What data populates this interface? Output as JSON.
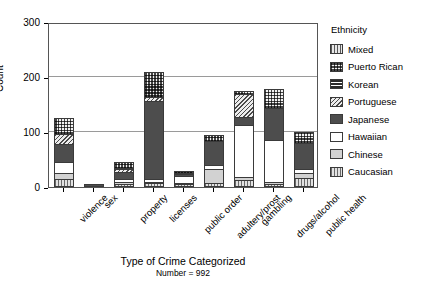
{
  "chart_data": {
    "type": "bar",
    "subtype": "stacked-bar",
    "title": "",
    "xlabel": "Type of Crime Categorized",
    "xsublabel": "Number = 992",
    "ylabel": "Count",
    "ylim": [
      0,
      300
    ],
    "yticks": [
      0,
      100,
      200,
      300
    ],
    "ytick_labels": [
      "0",
      "100",
      "200",
      "300"
    ],
    "grid": "horizontal",
    "legend_title": "Ethnicity",
    "legend_position": "right",
    "categories": [
      "violence",
      "sex",
      "property",
      "licenses",
      "public order",
      "adultery/prost",
      "gambling",
      "drugs/alcohol",
      "public health"
    ],
    "series": [
      {
        "name": "Mixed",
        "pattern": "p-mixed",
        "values": [
          0,
          0,
          0,
          0,
          0,
          0,
          0,
          0,
          0
        ]
      },
      {
        "name": "Puerto Rican",
        "pattern": "p-puertorican",
        "values": [
          28,
          0,
          10,
          47,
          4,
          12,
          6,
          35,
          20
        ]
      },
      {
        "name": "Korean",
        "pattern": "p-korean",
        "values": [
          0,
          0,
          3,
          0,
          0,
          0,
          0,
          0,
          0
        ]
      },
      {
        "name": "Portuguese",
        "pattern": "p-portuguese",
        "values": [
          19,
          0,
          4,
          6,
          3,
          0,
          42,
          0,
          0
        ]
      },
      {
        "name": "Japanese",
        "pattern": "p-japanese",
        "values": [
          33,
          4,
          14,
          142,
          3,
          43,
          15,
          58,
          48
        ]
      },
      {
        "name": "Hawaiian",
        "pattern": "p-hawaiian",
        "values": [
          20,
          0,
          5,
          6,
          12,
          8,
          93,
          76,
          7
        ]
      },
      {
        "name": "Chinese",
        "pattern": "p-chinese",
        "values": [
          10,
          0,
          3,
          2,
          3,
          24,
          6,
          3,
          9
        ]
      },
      {
        "name": "Caucasian",
        "pattern": "p-caucasian",
        "values": [
          15,
          1,
          6,
          7,
          5,
          8,
          13,
          6,
          16
        ]
      }
    ],
    "totals": [
      125,
      5,
      45,
      210,
      30,
      95,
      175,
      178,
      100
    ]
  },
  "legend": {
    "title": "Ethnicity",
    "items": [
      {
        "label": "Mixed",
        "pattern": "p-mixed"
      },
      {
        "label": "Puerto Rican",
        "pattern": "p-puertorican"
      },
      {
        "label": "Korean",
        "pattern": "p-korean"
      },
      {
        "label": "Portuguese",
        "pattern": "p-portuguese"
      },
      {
        "label": "Japanese",
        "pattern": "p-japanese"
      },
      {
        "label": "Hawaiian",
        "pattern": "p-hawaiian"
      },
      {
        "label": "Chinese",
        "pattern": "p-chinese"
      },
      {
        "label": "Caucasian",
        "pattern": "p-caucasian"
      }
    ]
  },
  "colors": {
    "frame": "#555555",
    "gridline": "#9a9a9a",
    "japanese": "#4d4d4d",
    "chinese": "#d2d2d2",
    "background": "#ffffff"
  }
}
